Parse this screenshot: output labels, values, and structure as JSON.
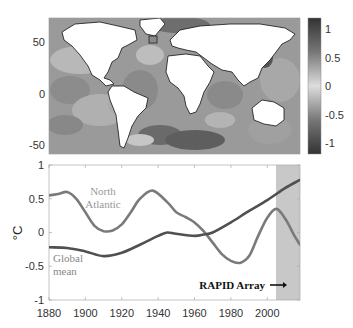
{
  "chart_data": [
    {
      "type": "heatmap",
      "title": "",
      "description": "World map of sea surface temperature trend anomaly (grayscale), continents white with black outlines, small square box marked in subpolar North Atlantic",
      "ylabel": "",
      "yticks": [
        "50",
        "0",
        "-50"
      ],
      "colorbar": {
        "ticks": [
          "1",
          "0.5",
          "0",
          "-0.5",
          "-1"
        ],
        "range": [
          -1.2,
          1.2
        ],
        "colors": {
          "high": "#3a3a3a",
          "mid": "#d8d8d8",
          "low": "#3a3a3a"
        }
      }
    },
    {
      "type": "line",
      "title": "",
      "xlabel": "",
      "ylabel": "°C",
      "xlim": [
        1880,
        2018
      ],
      "ylim": [
        -1,
        1
      ],
      "xticks": [
        "1880",
        "1900",
        "1920",
        "1940",
        "1960",
        "1980",
        "2000"
      ],
      "yticks": [
        "1",
        "0.5",
        "0",
        "-0.5",
        "-1"
      ],
      "series": [
        {
          "name": "North Atlantic",
          "color": "#7a7a7a",
          "x": [
            1880,
            1885,
            1890,
            1895,
            1900,
            1905,
            1910,
            1915,
            1920,
            1925,
            1930,
            1937,
            1945,
            1950,
            1955,
            1960,
            1965,
            1970,
            1975,
            1980,
            1985,
            1990,
            1995,
            2000,
            2005,
            2010,
            2015,
            2018
          ],
          "values": [
            0.55,
            0.57,
            0.6,
            0.5,
            0.3,
            0.1,
            0.02,
            0.03,
            0.12,
            0.3,
            0.5,
            0.62,
            0.45,
            0.3,
            0.23,
            0.15,
            0.02,
            -0.15,
            -0.32,
            -0.42,
            -0.45,
            -0.35,
            -0.05,
            0.22,
            0.35,
            0.2,
            -0.05,
            -0.18
          ]
        },
        {
          "name": "Global mean",
          "color": "#505050",
          "x": [
            1880,
            1890,
            1900,
            1910,
            1920,
            1930,
            1940,
            1945,
            1950,
            1960,
            1965,
            1970,
            1980,
            1990,
            2000,
            2010,
            2018
          ],
          "values": [
            -0.22,
            -0.23,
            -0.28,
            -0.35,
            -0.3,
            -0.18,
            -0.05,
            0.0,
            -0.02,
            -0.05,
            -0.03,
            0.0,
            0.15,
            0.32,
            0.48,
            0.66,
            0.78
          ]
        }
      ],
      "annotations": [
        {
          "text": "North Atlantic",
          "x": 1943,
          "y": 0.5
        },
        {
          "text": "Global mean",
          "x": 1883,
          "y": -0.45
        },
        {
          "text": "RAPID Array",
          "x": 2004,
          "y": -0.78,
          "arrow": true
        }
      ],
      "shaded_region": {
        "x0": 2004,
        "x1": 2018,
        "color": "#c8c8c8"
      },
      "grid": false
    }
  ],
  "labels": {
    "map_y_50": "50",
    "map_y_0": "0",
    "map_y_m50": "-50",
    "cb_1": "1",
    "cb_05": "0.5",
    "cb_0": "0",
    "cb_m05": "-0.5",
    "cb_m1": "-1",
    "ts_y_1": "1",
    "ts_y_05": "0.5",
    "ts_y_0": "0",
    "ts_y_m05": "-0.5",
    "ts_y_m1": "-1",
    "ts_x_1880": "1880",
    "ts_x_1900": "1900",
    "ts_x_1920": "1920",
    "ts_x_1940": "1940",
    "ts_x_1960": "1960",
    "ts_x_1980": "1980",
    "ts_x_2000": "2000",
    "ylabel": "°C",
    "na_line1": "North",
    "na_line2": "Atlantic",
    "gm_line1": "Global",
    "gm_line2": "mean",
    "rapid": "RAPID Array"
  }
}
